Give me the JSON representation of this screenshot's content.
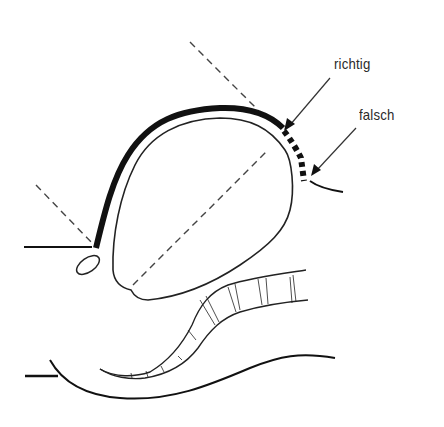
{
  "diagram": {
    "labels": {
      "correct": "richtig",
      "incorrect": "falsch"
    },
    "colors": {
      "line": "#111111",
      "thin_line": "#222222",
      "dash": "#444444",
      "background": "#ffffff"
    },
    "elements": [
      "organ-outline",
      "thick-serosa-arc",
      "dashed-incision-lines",
      "dotted-wrong-segment",
      "arrow-richtig",
      "arrow-falsch",
      "small-oval",
      "tubular-structure",
      "lower-contour"
    ]
  }
}
